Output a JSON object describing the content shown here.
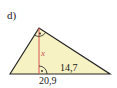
{
  "task": {
    "label": "d)"
  },
  "figure": {
    "type": "right-triangle-with-altitude",
    "fill_color": "#f7f2c4",
    "stroke_color": "#222222",
    "altitude_color": "#d9534f",
    "angle_mark_color": "#222222",
    "labels": {
      "altitude": "x",
      "segment": "14,7",
      "base": "20,9"
    }
  }
}
